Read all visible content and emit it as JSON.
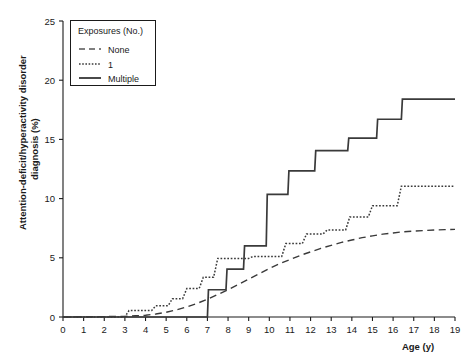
{
  "chart_data": {
    "type": "line",
    "title": "",
    "subtitle": "",
    "xlabel": "Age (y)",
    "ylabel": "Attention-deficit/hyperactivity disorder diagnosis (%)",
    "xlim": [
      0,
      19
    ],
    "ylim": [
      0,
      25
    ],
    "xticks": [
      0,
      1,
      2,
      3,
      4,
      5,
      6,
      7,
      8,
      9,
      10,
      11,
      12,
      13,
      14,
      15,
      16,
      17,
      18,
      19
    ],
    "xtick_labels": [
      "0",
      "1",
      "2",
      "3",
      "4",
      "5",
      "6",
      "7",
      "8",
      "9",
      "10",
      "11",
      "12",
      "13",
      "14",
      "15",
      "16",
      "17",
      "18",
      "19"
    ],
    "yticks": [
      0,
      5,
      10,
      15,
      20,
      25
    ],
    "ytick_labels": [
      "0",
      "5",
      "10",
      "15",
      "20",
      "25"
    ],
    "grid": false,
    "legend_position": "top-left",
    "legend_title": "Exposures (No.)",
    "curve_style": "step-post",
    "series": [
      {
        "name": "None",
        "line_style": "dashed",
        "color": "#555555",
        "x": [
          0,
          3.0,
          3.5,
          4.0,
          4.5,
          5.0,
          5.5,
          6.0,
          6.5,
          7.0,
          7.5,
          8.0,
          8.5,
          9.0,
          9.5,
          10.0,
          10.5,
          11.0,
          11.5,
          12.0,
          12.5,
          13.0,
          13.5,
          14.0,
          14.5,
          15.0,
          15.5,
          16.0,
          16.5,
          17.0,
          17.5,
          18.0,
          18.5,
          19.0
        ],
        "values": [
          0.0,
          0.05,
          0.1,
          0.15,
          0.25,
          0.4,
          0.6,
          0.85,
          1.15,
          1.5,
          1.9,
          2.3,
          2.75,
          3.2,
          3.65,
          4.1,
          4.5,
          4.85,
          5.2,
          5.5,
          5.8,
          6.05,
          6.3,
          6.5,
          6.7,
          6.85,
          7.0,
          7.1,
          7.2,
          7.25,
          7.3,
          7.35,
          7.38,
          7.4
        ]
      },
      {
        "name": "1",
        "line_style": "dotted",
        "color": "#3a3a3a",
        "x": [
          0,
          3.0,
          3.2,
          4.3,
          4.5,
          5.1,
          5.3,
          5.8,
          6.0,
          6.6,
          6.8,
          7.3,
          7.5,
          9.0,
          9.2,
          10.6,
          10.8,
          11.6,
          11.8,
          12.6,
          12.8,
          13.7,
          13.9,
          14.8,
          15.0,
          16.2,
          16.4,
          19.0
        ],
        "values": [
          0.0,
          0.0,
          0.55,
          0.55,
          0.95,
          0.95,
          1.55,
          1.55,
          2.4,
          2.4,
          3.35,
          3.35,
          4.95,
          4.95,
          5.1,
          5.1,
          6.2,
          6.2,
          7.0,
          7.0,
          7.35,
          7.35,
          8.45,
          8.45,
          9.4,
          9.4,
          11.05,
          11.05
        ]
      },
      {
        "name": "Multiple",
        "line_style": "solid",
        "color": "#2a2a2a",
        "x": [
          0,
          7.0,
          7.05,
          7.9,
          7.95,
          8.75,
          8.8,
          9.85,
          9.9,
          10.9,
          10.95,
          12.2,
          12.25,
          13.8,
          13.85,
          15.2,
          15.25,
          16.4,
          16.45,
          19.0
        ],
        "values": [
          0.0,
          0.0,
          2.3,
          2.3,
          4.05,
          4.05,
          6.0,
          6.0,
          10.35,
          10.35,
          12.35,
          12.35,
          14.05,
          14.05,
          15.1,
          15.1,
          16.7,
          16.7,
          18.4,
          18.4
        ]
      }
    ]
  },
  "legend": {
    "title": "Exposures (No.)",
    "entries": [
      {
        "label": "None",
        "style": "dashed"
      },
      {
        "label": "1",
        "style": "dotted"
      },
      {
        "label": "Multiple",
        "style": "solid"
      }
    ]
  },
  "axes": {
    "x_title": "Age (y)",
    "y_title_line1": "Attention-deficit/hyperactivity disorder",
    "y_title_line2": "diagnosis (%)"
  }
}
